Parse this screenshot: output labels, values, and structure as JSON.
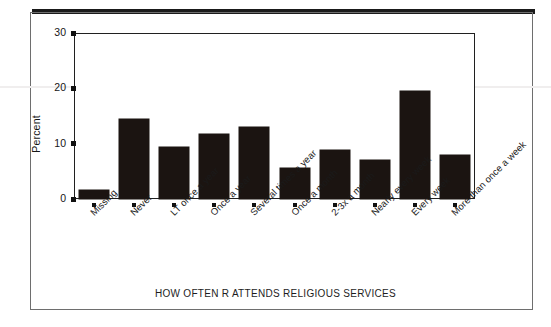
{
  "figure": {
    "background": "#ffffff",
    "frame_color": "#6e6e6e",
    "axis_color": "#202020",
    "bar_color": "#1b1411"
  },
  "chart_data": {
    "type": "bar",
    "title": "",
    "xlabel": "HOW OFTEN R ATTENDS RELIGIOUS SERVICES",
    "ylabel": "Percent",
    "ylim": [
      0,
      30
    ],
    "yticks": [
      0,
      10,
      20,
      30
    ],
    "grid": false,
    "legend": null,
    "categories": [
      "Missing",
      "Never",
      "LT once a year",
      "Once a year",
      "Several times a year",
      "Once a month",
      "2-3x a month",
      "Nearly every week",
      "Every week",
      "More than once a week"
    ],
    "values": [
      1.6,
      14.4,
      9.4,
      11.7,
      13.1,
      5.6,
      8.8,
      7.1,
      19.6,
      7.9
    ]
  }
}
